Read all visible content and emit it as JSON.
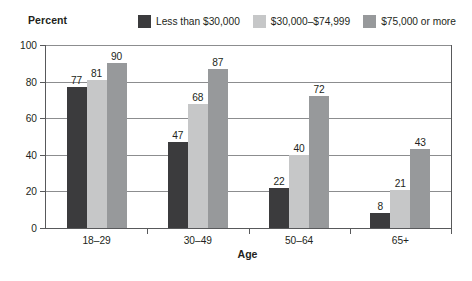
{
  "chart_data": {
    "type": "bar",
    "title": "",
    "ylabel": "Percent",
    "xlabel": "Age",
    "categories": [
      "18–29",
      "30–49",
      "50–64",
      "65+"
    ],
    "series": [
      {
        "name": "Less than $30,000",
        "color": "#3b3b3d",
        "values": [
          77,
          47,
          22,
          8
        ]
      },
      {
        "name": "$30,000–$74,999",
        "color": "#c6c7c8",
        "values": [
          81,
          68,
          40,
          21
        ]
      },
      {
        "name": "$75,000 or more",
        "color": "#97999b",
        "values": [
          90,
          87,
          72,
          43
        ]
      }
    ],
    "ylim": [
      0,
      100
    ],
    "yticks": [
      0,
      20,
      40,
      60,
      80,
      100
    ],
    "ytick_labels": [
      "0",
      "20",
      "40",
      "60",
      "80",
      "100"
    ],
    "grid": true,
    "grid_axis": "y",
    "legend_position": "top",
    "data_labels": true
  },
  "axes": {
    "y_unit_label": "Percent",
    "x_axis_title": "Age",
    "y_tick_0": "0",
    "y_tick_20": "20",
    "y_tick_40": "40",
    "y_tick_60": "60",
    "y_tick_80": "80",
    "y_tick_100": "100"
  },
  "legend": {
    "items": [
      {
        "label": "Less than $30,000",
        "color": "#3b3b3d"
      },
      {
        "label": "$30,000–$74,999",
        "color": "#c6c7c8"
      },
      {
        "label": "$75,000 or more",
        "color": "#97999b"
      }
    ]
  },
  "groups": [
    {
      "category": "18–29",
      "bars": [
        {
          "series": "Less than $30,000",
          "value": 77,
          "label": "77",
          "color": "#3b3b3d"
        },
        {
          "series": "$30,000–$74,999",
          "value": 81,
          "label": "81",
          "color": "#c6c7c8"
        },
        {
          "series": "$75,000 or more",
          "value": 90,
          "label": "90",
          "color": "#97999b"
        }
      ]
    },
    {
      "category": "30–49",
      "bars": [
        {
          "series": "Less than $30,000",
          "value": 47,
          "label": "47",
          "color": "#3b3b3d"
        },
        {
          "series": "$30,000–$74,999",
          "value": 68,
          "label": "68",
          "color": "#c6c7c8"
        },
        {
          "series": "$75,000 or more",
          "value": 87,
          "label": "87",
          "color": "#97999b"
        }
      ]
    },
    {
      "category": "50–64",
      "bars": [
        {
          "series": "Less than $30,000",
          "value": 22,
          "label": "22",
          "color": "#3b3b3d"
        },
        {
          "series": "$30,000–$74,999",
          "value": 40,
          "label": "40",
          "color": "#c6c7c8"
        },
        {
          "series": "$75,000 or more",
          "value": 72,
          "label": "72",
          "color": "#97999b"
        }
      ]
    },
    {
      "category": "65+",
      "bars": [
        {
          "series": "Less than $30,000",
          "value": 8,
          "label": "8",
          "color": "#3b3b3d"
        },
        {
          "series": "$30,000–$74,999",
          "value": 21,
          "label": "21",
          "color": "#c6c7c8"
        },
        {
          "series": "$75,000 or more",
          "value": 43,
          "label": "43",
          "color": "#97999b"
        }
      ]
    }
  ],
  "colors": {
    "axis": "#58595b",
    "gridline": "#8c8d8f",
    "text": "#231f20",
    "background": "#ffffff"
  }
}
